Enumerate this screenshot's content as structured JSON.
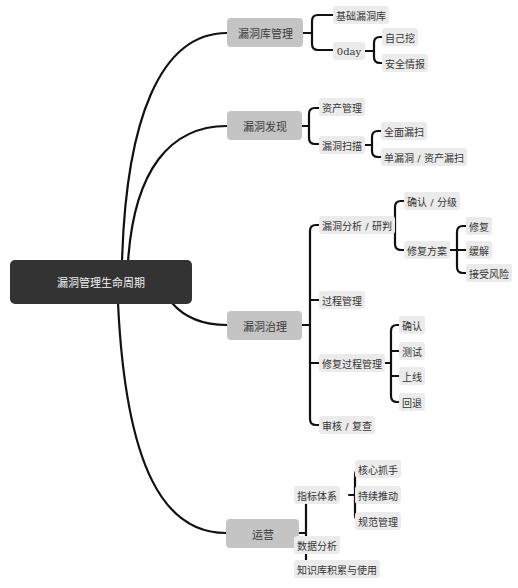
{
  "mindmap": {
    "root": {
      "label": "漏洞管理生命周期"
    },
    "branches": [
      {
        "label": "漏洞库管理",
        "children": [
          {
            "label": "基础漏洞库"
          },
          {
            "label": "0day",
            "children": [
              {
                "label": "自己挖"
              },
              {
                "label": "安全情报"
              }
            ]
          }
        ]
      },
      {
        "label": "漏洞发现",
        "children": [
          {
            "label": "资产管理"
          },
          {
            "label": "漏洞扫描",
            "children": [
              {
                "label": "全面漏扫"
              },
              {
                "label": "单漏洞 / 资产漏扫"
              }
            ]
          }
        ]
      },
      {
        "label": "漏洞治理",
        "children": [
          {
            "label": "漏洞分析 / 研判",
            "children": [
              {
                "label": "确认 / 分级"
              },
              {
                "label": "修复方案",
                "children": [
                  {
                    "label": "修复"
                  },
                  {
                    "label": "缓解"
                  },
                  {
                    "label": "接受风险"
                  }
                ]
              }
            ]
          },
          {
            "label": "过程管理"
          },
          {
            "label": "修复过程管理",
            "children": [
              {
                "label": "确认"
              },
              {
                "label": "测试"
              },
              {
                "label": "上线"
              },
              {
                "label": "回退"
              }
            ]
          },
          {
            "label": "审核 / 复查"
          }
        ]
      },
      {
        "label": "运营",
        "children": [
          {
            "label": "指标体系",
            "children": [
              {
                "label": "核心抓手"
              },
              {
                "label": "持续推动"
              },
              {
                "label": "规范管理"
              }
            ]
          },
          {
            "label": "数据分析"
          },
          {
            "label": "知识库积累与使用"
          }
        ]
      }
    ]
  },
  "colors": {
    "root_bg": "#333333",
    "root_text": "#f2f2f2",
    "branch_bg": "#c4c4c4",
    "leaf_bg": "#ebebeb",
    "connector": "#111111",
    "background": "#ffffff"
  }
}
